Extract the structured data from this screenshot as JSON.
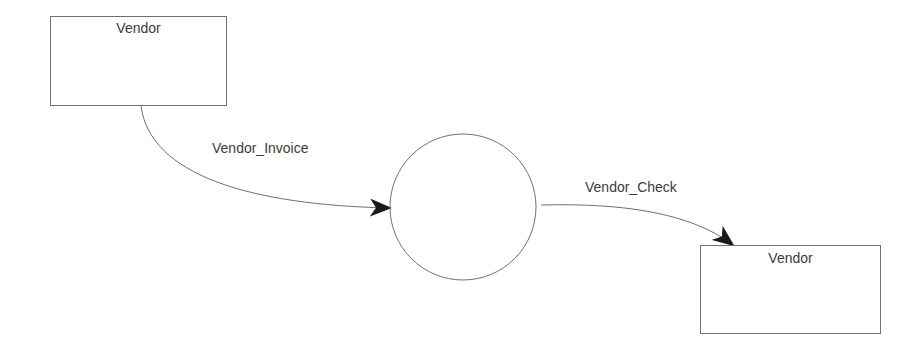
{
  "diagram": {
    "type": "data-flow-diagram",
    "entities": [
      {
        "id": "vendor_source",
        "label": "Vendor"
      },
      {
        "id": "vendor_sink",
        "label": "Vendor"
      }
    ],
    "process": {
      "id": "process",
      "label": ""
    },
    "flows": [
      {
        "from": "vendor_source",
        "to": "process",
        "label": "Vendor_Invoice"
      },
      {
        "from": "process",
        "to": "vendor_sink",
        "label": "Vendor_Check"
      }
    ],
    "colors": {
      "stroke": "#707070",
      "text": "#3a3a3a",
      "arrowhead": "#1a1a1a"
    }
  }
}
